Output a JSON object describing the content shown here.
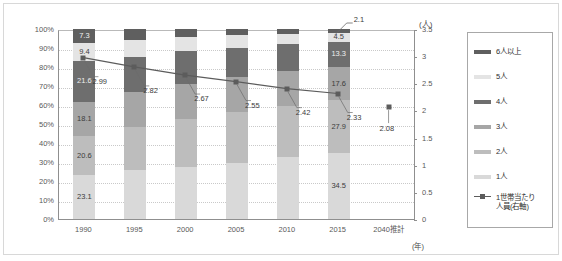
{
  "axes": {
    "left_ticks": [
      "100%",
      "90%",
      "80%",
      "70%",
      "60%",
      "50%",
      "40%",
      "30%",
      "20%",
      "10%",
      "0%"
    ],
    "right_ticks": [
      "3.5",
      "3",
      "2.5",
      "2",
      "1.5",
      "1",
      "0.5",
      "0"
    ],
    "right_unit": "(人)",
    "x_unit": "(年)",
    "x_ticks": [
      "1990",
      "1995",
      "2000",
      "2005",
      "2010",
      "2015",
      "2040推計"
    ]
  },
  "legend": {
    "items": [
      {
        "label": "6人以上",
        "color": "#5f5f5f"
      },
      {
        "label": "5人",
        "color": "#e4e4e4"
      },
      {
        "label": "4人",
        "color": "#6e6e6e"
      },
      {
        "label": "3人",
        "color": "#a6a6a6"
      },
      {
        "label": "2人",
        "color": "#bdbdbd"
      },
      {
        "label": "1人",
        "color": "#d9d9d9"
      }
    ],
    "series": {
      "label": "1世帯当たり\n人員(右軸)",
      "color": "#5c5c5c"
    }
  },
  "chart_data": {
    "type": "bar",
    "title": "",
    "xlabel": "(年)",
    "ylabel": "",
    "ylim": [
      0,
      100
    ],
    "y2lim": [
      0,
      3.5
    ],
    "grid": true,
    "legend_position": "right",
    "categories": [
      "1990",
      "1995",
      "2000",
      "2005",
      "2010",
      "2015",
      "2040推計"
    ],
    "series": [
      {
        "name": "1人",
        "color": "#d9d9d9",
        "values": [
          23.1,
          25.6,
          27.6,
          29.5,
          32.4,
          34.5,
          null
        ]
      },
      {
        "name": "2人",
        "color": "#bdbdbd",
        "values": [
          20.6,
          22.6,
          25.1,
          26.8,
          27.2,
          27.9,
          null
        ]
      },
      {
        "name": "3人",
        "color": "#a6a6a6",
        "values": [
          18.1,
          18.4,
          18.6,
          18.2,
          18.2,
          17.6,
          null
        ]
      },
      {
        "name": "4人",
        "color": "#6e6e6e",
        "values": [
          21.6,
          18.8,
          17.0,
          15.5,
          14.4,
          13.3,
          null
        ]
      },
      {
        "name": "5人",
        "color": "#e4e4e4",
        "values": [
          9.4,
          8.8,
          7.7,
          6.7,
          5.3,
          4.5,
          null
        ]
      },
      {
        "name": "6人以上",
        "color": "#5f5f5f",
        "values": [
          7.3,
          5.8,
          4.0,
          3.3,
          2.5,
          2.1,
          null
        ]
      }
    ],
    "line_series": {
      "name": "1世帯当たり人員(右軸)",
      "axis": "right",
      "color": "#5c5c5c",
      "x": [
        "1990",
        "1995",
        "2000",
        "2005",
        "2010",
        "2015",
        "2040推計"
      ],
      "values": [
        2.99,
        2.82,
        2.67,
        2.55,
        2.42,
        2.33,
        2.08
      ],
      "connected": [
        true,
        true,
        true,
        true,
        true,
        true,
        false
      ]
    },
    "bar_labels": {
      "1990": {
        "6人以上": "7.3",
        "5人": "9.4",
        "4人": "21.6",
        "3人": "18.1",
        "2人": "20.6",
        "1人": "23.1"
      },
      "2015": {
        "6人以上": "2.1",
        "5人": "4.5",
        "4人": "13.3",
        "3人": "17.6",
        "2人": "27.9",
        "1人": "34.5"
      }
    },
    "line_labels": [
      "2.99",
      "2.82",
      "2.67",
      "2.55",
      "2.42",
      "2.33",
      "2.08"
    ]
  }
}
